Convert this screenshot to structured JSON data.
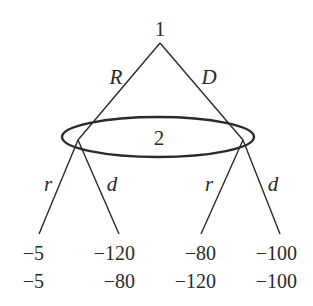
{
  "diagram": {
    "type": "extensive-form game tree",
    "root": {
      "player": "1"
    },
    "info_set": {
      "player": "2"
    },
    "player1_actions": [
      {
        "label": "R"
      },
      {
        "label": "D"
      }
    ],
    "player2_actions_left": [
      {
        "label": "r"
      },
      {
        "label": "d"
      }
    ],
    "player2_actions_right": [
      {
        "label": "r"
      },
      {
        "label": "d"
      }
    ],
    "payoffs": [
      {
        "p1": "−5",
        "p2": "−5"
      },
      {
        "p1": "−120",
        "p2": "−80"
      },
      {
        "p1": "−80",
        "p2": "−120"
      },
      {
        "p1": "−100",
        "p2": "−100"
      }
    ],
    "colors": {
      "ink": "#2a2a2a",
      "background": "#ffffff"
    }
  }
}
